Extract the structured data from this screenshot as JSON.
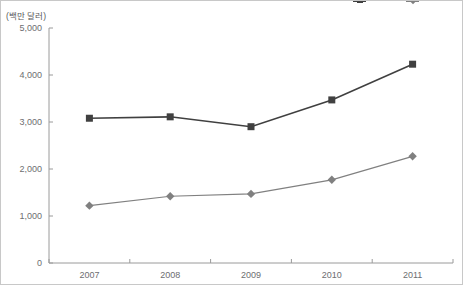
{
  "figure": {
    "unit_label": "(백만 달러)",
    "width": 463,
    "height": 285,
    "border_color": "#c8c8c8",
    "background": "#ffffff"
  },
  "legend": {
    "position": "top-right",
    "items": [
      {
        "name": "series-1-legend",
        "label": "",
        "marker": "square",
        "color": "#404040"
      },
      {
        "name": "series-2-legend",
        "label": "",
        "marker": "diamond",
        "color": "#808080"
      }
    ]
  },
  "axes": {
    "y": {
      "ticks": [
        "0",
        "1,000",
        "2,000",
        "3,000",
        "4,000",
        "5,000"
      ],
      "values": [
        0,
        1000,
        2000,
        3000,
        4000,
        5000
      ],
      "min": 0,
      "max": 5000,
      "color": "#9a9a9a"
    },
    "x": {
      "ticks": [
        "2007",
        "2008",
        "2009",
        "2010",
        "2011"
      ],
      "color": "#9a9a9a"
    }
  },
  "chart_data": {
    "type": "line",
    "title": "",
    "subtitle": "",
    "xlabel": "",
    "ylabel": "(백만 달러)",
    "categories": [
      "2007",
      "2008",
      "2009",
      "2010",
      "2011"
    ],
    "ylim": [
      0,
      5000
    ],
    "yticks": [
      0,
      1000,
      2000,
      3000,
      4000,
      5000
    ],
    "grid": false,
    "legend_position": "top-right",
    "series": [
      {
        "name": "Series 1",
        "marker": "square",
        "color": "#404040",
        "values": [
          3080,
          3110,
          2900,
          3470,
          4230
        ]
      },
      {
        "name": "Series 2",
        "marker": "diamond",
        "color": "#808080",
        "values": [
          1220,
          1420,
          1470,
          1770,
          2270
        ]
      }
    ],
    "annotations": []
  }
}
